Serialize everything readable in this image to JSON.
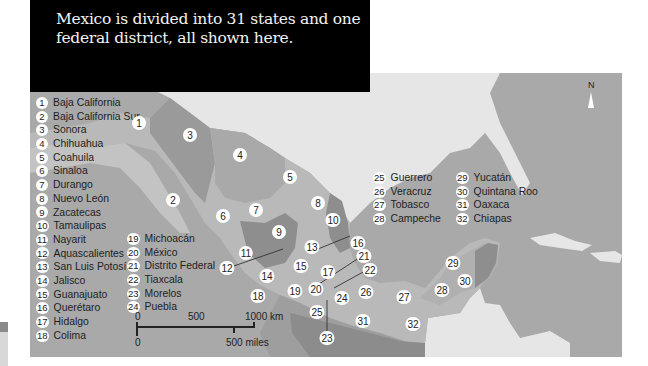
{
  "caption": "Mexico is divided into 31 states and one federal district, all shown here.",
  "compass": {
    "label": "N"
  },
  "scale": {
    "km_labels": [
      "0",
      "500",
      "1000 km"
    ],
    "mile_labels": [
      "0",
      "500 miles"
    ]
  },
  "legend_col1": [
    {
      "n": "1",
      "name": "Baja California"
    },
    {
      "n": "2",
      "name": "Baja California Sur"
    },
    {
      "n": "3",
      "name": "Sonora"
    },
    {
      "n": "4",
      "name": "Chihuahua"
    },
    {
      "n": "5",
      "name": "Coahuila"
    },
    {
      "n": "6",
      "name": "Sinaloa"
    },
    {
      "n": "7",
      "name": "Durango"
    },
    {
      "n": "8",
      "name": "Nuevo León"
    },
    {
      "n": "9",
      "name": "Zacatecas"
    },
    {
      "n": "10",
      "name": "Tamaulipas"
    },
    {
      "n": "11",
      "name": "Nayarit"
    },
    {
      "n": "12",
      "name": "Aquascalientes"
    },
    {
      "n": "13",
      "name": "San Luis Potosí"
    },
    {
      "n": "14",
      "name": "Jalisco"
    },
    {
      "n": "15",
      "name": "Guanajuato"
    },
    {
      "n": "16",
      "name": "Querétaro"
    },
    {
      "n": "17",
      "name": "Hidalgo"
    },
    {
      "n": "18",
      "name": "Colima"
    }
  ],
  "legend_col2": [
    {
      "n": "19",
      "name": "Michoacán"
    },
    {
      "n": "20",
      "name": "México"
    },
    {
      "n": "21",
      "name": "Distrito Federal"
    },
    {
      "n": "22",
      "name": "Tiaxcala"
    },
    {
      "n": "23",
      "name": "Morelos"
    },
    {
      "n": "24",
      "name": "Puebla"
    }
  ],
  "legend_col3": [
    {
      "n": "25",
      "name": "Guerrero"
    },
    {
      "n": "26",
      "name": "Veracruz"
    },
    {
      "n": "27",
      "name": "Tobasco"
    },
    {
      "n": "28",
      "name": "Campeche"
    }
  ],
  "legend_col4": [
    {
      "n": "29",
      "name": "Yucatán"
    },
    {
      "n": "30",
      "name": "Quintana Roo"
    },
    {
      "n": "31",
      "name": "Oaxaca"
    },
    {
      "n": "32",
      "name": "Chiapas"
    }
  ],
  "markers": [
    {
      "n": "1",
      "x": 139,
      "y": 123
    },
    {
      "n": "2",
      "x": 173,
      "y": 200
    },
    {
      "n": "3",
      "x": 190,
      "y": 135
    },
    {
      "n": "4",
      "x": 240,
      "y": 155
    },
    {
      "n": "5",
      "x": 290,
      "y": 177
    },
    {
      "n": "6",
      "x": 223,
      "y": 216
    },
    {
      "n": "7",
      "x": 256,
      "y": 210
    },
    {
      "n": "8",
      "x": 318,
      "y": 203
    },
    {
      "n": "9",
      "x": 279,
      "y": 232
    },
    {
      "n": "10",
      "x": 333,
      "y": 220
    },
    {
      "n": "11",
      "x": 246,
      "y": 253
    },
    {
      "n": "12",
      "x": 227,
      "y": 268
    },
    {
      "n": "13",
      "x": 312,
      "y": 247
    },
    {
      "n": "14",
      "x": 267,
      "y": 276
    },
    {
      "n": "15",
      "x": 301,
      "y": 266
    },
    {
      "n": "16",
      "x": 358,
      "y": 243
    },
    {
      "n": "17",
      "x": 328,
      "y": 272
    },
    {
      "n": "18",
      "x": 258,
      "y": 296
    },
    {
      "n": "19",
      "x": 295,
      "y": 291
    },
    {
      "n": "20",
      "x": 316,
      "y": 289
    },
    {
      "n": "21",
      "x": 364,
      "y": 256
    },
    {
      "n": "22",
      "x": 370,
      "y": 270
    },
    {
      "n": "23",
      "x": 327,
      "y": 338
    },
    {
      "n": "24",
      "x": 342,
      "y": 298
    },
    {
      "n": "25",
      "x": 317,
      "y": 312
    },
    {
      "n": "26",
      "x": 366,
      "y": 292
    },
    {
      "n": "27",
      "x": 404,
      "y": 297
    },
    {
      "n": "28",
      "x": 442,
      "y": 290
    },
    {
      "n": "29",
      "x": 453,
      "y": 263
    },
    {
      "n": "30",
      "x": 465,
      "y": 281
    },
    {
      "n": "31",
      "x": 363,
      "y": 321
    },
    {
      "n": "32",
      "x": 413,
      "y": 324
    }
  ],
  "colors": {
    "sea": "#a9a9a9",
    "foreign_land": "#e6e6e6",
    "mexico_light": "#b7b7b7",
    "mexico_mid": "#9d9d9d",
    "mexico_dark": "#8a8a8a",
    "caption_bg": "#000000"
  }
}
